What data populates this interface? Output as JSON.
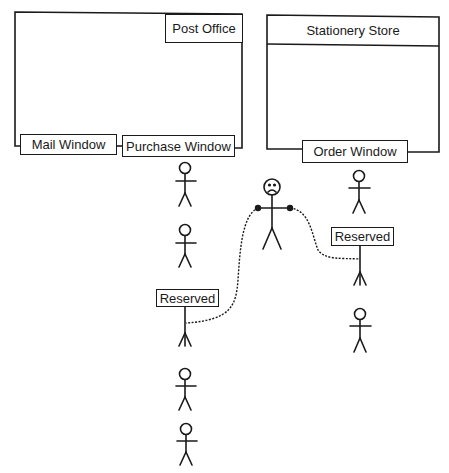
{
  "post_office": {
    "title": "Post Office",
    "windows": [
      "Mail Window",
      "Purchase Window"
    ]
  },
  "stationery_store": {
    "title": "Stationery Store",
    "windows": [
      "Order Window"
    ]
  },
  "signs": {
    "left_reserved": "Reserved",
    "right_reserved": "Reserved"
  },
  "figures": {
    "purchase_queue_count": 5,
    "order_queue_count": 3,
    "center_figure_expression": "sad"
  },
  "colors": {
    "ink": "#1a1a1a",
    "background": "#ffffff"
  }
}
